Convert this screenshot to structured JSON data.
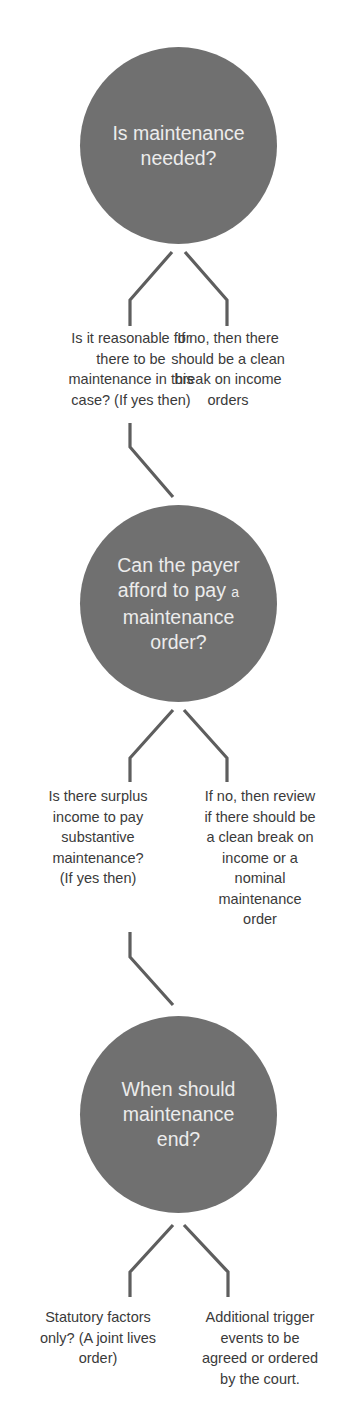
{
  "colors": {
    "circle_fill": "#707070",
    "circle_text": "#ececec",
    "body_text": "#3a3a3a",
    "connector": "#5e5e5e",
    "background": "#ffffff"
  },
  "steps": [
    {
      "question": "Is maintenance\nneeded?",
      "yes_branch": "Is it reasonable for\nthere to be\nmaintenance in this\ncase? (If yes then)",
      "no_branch": "If no, then there\nshould be a clean\nbreak on income\norders"
    },
    {
      "question_line1": "Can the payer",
      "question_line2_main": "afford to pay ",
      "question_line2_small": "a",
      "question_line3": "maintenance\norder?",
      "yes_branch": "Is there surplus\nincome to pay\nsubstantive\nmaintenance?\n(If yes then)",
      "no_branch": "If no, then review\nif there should be\na clean break on\nincome or a\nnominal\nmaintenance\norder"
    },
    {
      "question": "When should\nmaintenance\nend?",
      "yes_branch": "Statutory factors\nonly? (A joint lives\norder)",
      "no_branch": "Additional trigger\nevents to be\nagreed or ordered\nby the court."
    }
  ]
}
